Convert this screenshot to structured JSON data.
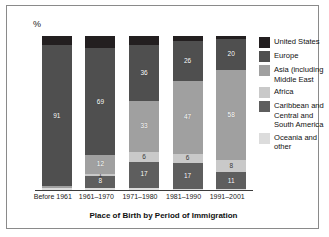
{
  "axis": {
    "y_unit": "%"
  },
  "caption": "Place of Birth by Period of Immigration",
  "legend": [
    {
      "label": "United States",
      "color": "#231f20"
    },
    {
      "label": "Europe",
      "color": "#4f4f4f"
    },
    {
      "label": "Asia (including Middle East",
      "color": "#a0a0a0"
    },
    {
      "label": "Africa",
      "color": "#c9c9c9"
    },
    {
      "label": "Caribbean and Central and South America",
      "color": "#5e5e5e"
    },
    {
      "label": "Oceania and other",
      "color": "#dcdcdc"
    }
  ],
  "chart_data": {
    "type": "bar",
    "subtype": "stacked-column",
    "title": "Place of Birth by Period of Immigration",
    "xlabel": "",
    "ylabel": "%",
    "ylim": [
      0,
      100
    ],
    "grid": false,
    "legend_position": "right",
    "categories": [
      "Before 1961",
      "1961–1970",
      "1971–1980",
      "1981–1990",
      "1991–2001"
    ],
    "series": [
      {
        "name": "United States",
        "color": "#231f20",
        "values": [
          6,
          8,
          6,
          3,
          2
        ],
        "labels": [
          "",
          "",
          "",
          "",
          ""
        ]
      },
      {
        "name": "Europe",
        "color": "#4f4f4f",
        "values": [
          91,
          69,
          36,
          26,
          20
        ],
        "labels": [
          "91",
          "69",
          "36",
          "26",
          "20"
        ]
      },
      {
        "name": "Asia (including Middle East",
        "color": "#a0a0a0",
        "values": [
          1,
          12,
          33,
          47,
          58
        ],
        "labels": [
          "",
          "12",
          "33",
          "47",
          "58"
        ]
      },
      {
        "name": "Africa",
        "color": "#c9c9c9",
        "values": [
          0,
          1,
          6,
          6,
          8
        ],
        "labels": [
          "",
          "1",
          "6",
          "6",
          "8"
        ]
      },
      {
        "name": "Caribbean and Central and South America",
        "color": "#5e5e5e",
        "values": [
          0,
          8,
          17,
          17,
          11
        ],
        "labels": [
          "",
          "8",
          "17",
          "17",
          "11"
        ]
      },
      {
        "name": "Oceania and other",
        "color": "#dcdcdc",
        "values": [
          2,
          2,
          2,
          1,
          1
        ],
        "labels": [
          "",
          "",
          "",
          "",
          ""
        ]
      }
    ]
  }
}
